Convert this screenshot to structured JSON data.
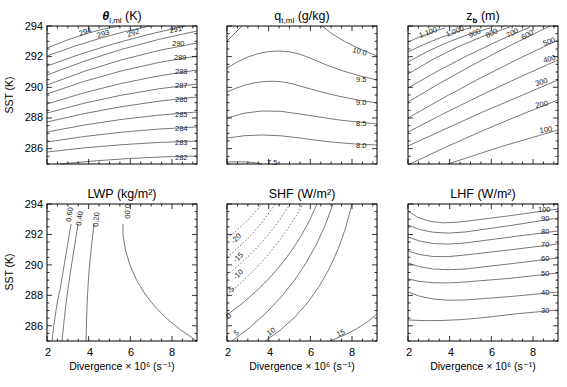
{
  "figure": {
    "x_axis_label": "Divergence × 10⁶ (s⁻¹)",
    "y_axis_label": "SST (K)",
    "x_ticks": [
      "2",
      "4",
      "6",
      "8"
    ],
    "y_ticks": [
      "286",
      "288",
      "290",
      "292",
      "294"
    ]
  },
  "chart_data": [
    {
      "type": "contour",
      "title": "θl,ml (K)",
      "xlabel": "",
      "ylabel": "SST (K)",
      "xlim": [
        2,
        9.2
      ],
      "ylim": [
        285,
        294
      ],
      "contour_levels": [
        282,
        283,
        284,
        285,
        286,
        287,
        288,
        289,
        290,
        291,
        292,
        293,
        294
      ],
      "contour_labels": [
        "294",
        "293",
        "292",
        "291",
        "290",
        "289",
        "288",
        "287",
        "286",
        "285",
        "284",
        "283",
        "282"
      ]
    },
    {
      "type": "contour",
      "title": "qt,ml (g/kg)",
      "xlabel": "",
      "ylabel": "",
      "xlim": [
        2,
        9.2
      ],
      "ylim": [
        285,
        294
      ],
      "contour_levels": [
        7.5,
        8.0,
        8.5,
        9.0,
        9.5,
        10.0
      ],
      "contour_labels": [
        "10.0",
        "9.5",
        "9.0",
        "8.5",
        "8.0",
        "7.5"
      ]
    },
    {
      "type": "contour",
      "title": "zb (m)",
      "xlabel": "",
      "ylabel": "",
      "xlim": [
        2,
        9.2
      ],
      "ylim": [
        285,
        294
      ],
      "contour_levels": [
        100,
        200,
        300,
        400,
        500,
        600,
        700,
        800,
        900,
        1000,
        1100
      ],
      "contour_labels": [
        "1,100",
        "1,000",
        "900",
        "800",
        "700",
        "600",
        "500",
        "400",
        "300",
        "200",
        "100"
      ]
    },
    {
      "type": "contour",
      "title": "LWP (kg/m²)",
      "xlabel": "Divergence × 10⁶ (s⁻¹)",
      "ylabel": "SST (K)",
      "xlim": [
        2,
        9.2
      ],
      "ylim": [
        285,
        294
      ],
      "contour_levels": [
        0.0,
        0.2,
        0.4,
        0.6
      ],
      "contour_labels": [
        "0.60",
        "0.40",
        "0.20",
        "0.00"
      ]
    },
    {
      "type": "contour",
      "title": "SHF (W/m²)",
      "xlabel": "Divergence × 10⁶ (s⁻¹)",
      "ylabel": "",
      "xlim": [
        2,
        9.2
      ],
      "ylim": [
        285,
        294
      ],
      "contour_levels": [
        -20,
        -15,
        -10,
        -5,
        0,
        5,
        10,
        15
      ],
      "contour_labels": [
        "-20",
        "-15",
        "-10",
        "-5",
        "0",
        "5",
        "10",
        "15"
      ],
      "negative_dashed": true
    },
    {
      "type": "contour",
      "title": "LHF (W/m²)",
      "xlabel": "Divergence × 10⁶ (s⁻¹)",
      "ylabel": "",
      "xlim": [
        2,
        9.2
      ],
      "ylim": [
        285,
        294
      ],
      "contour_levels": [
        30,
        40,
        50,
        60,
        70,
        80,
        90,
        100
      ],
      "contour_labels": [
        "100",
        "90",
        "80",
        "70",
        "60",
        "50",
        "40",
        "30"
      ]
    }
  ],
  "panels": [
    {
      "title_main": "θ",
      "title_sub": "l,ml",
      "title_unit": " (K)",
      "labels": [
        "294",
        "293",
        "292",
        "291",
        "290",
        "289",
        "288",
        "287",
        "286",
        "285",
        "284",
        "283",
        "282"
      ]
    },
    {
      "title_main": "q",
      "title_sub": "t,ml",
      "title_unit": " (g/kg)",
      "labels": [
        "10.0",
        "9.5",
        "9.0",
        "8.5",
        "8.0",
        "7.5"
      ]
    },
    {
      "title_main": "z",
      "title_sub": "b",
      "title_unit": " (m)",
      "labels": [
        "1,100",
        "1,000",
        "900",
        "800",
        "700",
        "600",
        "500",
        "400",
        "300",
        "200",
        "100"
      ]
    },
    {
      "title_main": "LWP",
      "title_unit": " (kg/m²)",
      "labels": [
        "0.60",
        "0.40",
        "0.20",
        "0.00"
      ]
    },
    {
      "title_main": "SHF",
      "title_unit": " (W/m²)",
      "labels": [
        "-20",
        "-15",
        "-10",
        "-5",
        "0",
        "5",
        "10",
        "15"
      ]
    },
    {
      "title_main": "LHF",
      "title_unit": " (W/m²)",
      "labels": [
        "100",
        "90",
        "80",
        "70",
        "60",
        "50",
        "40",
        "30"
      ]
    }
  ]
}
